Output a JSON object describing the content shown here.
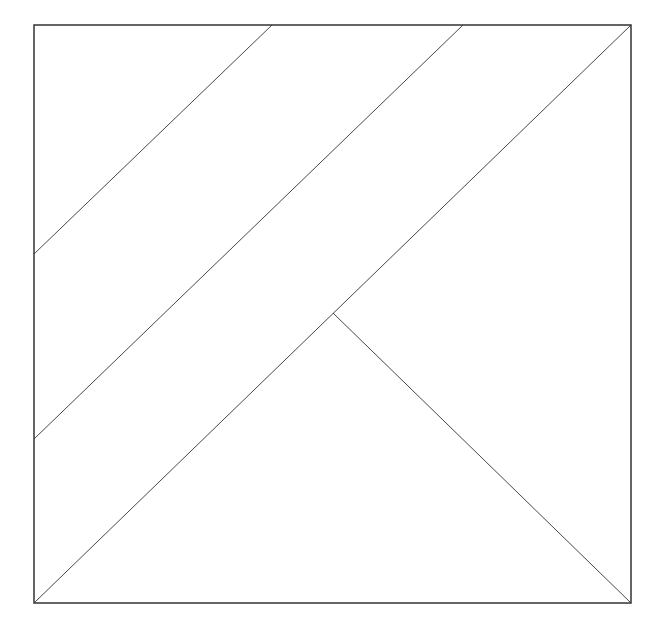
{
  "diagram": {
    "type": "geometric-dissection",
    "stroke_color": "#333333",
    "outer_square": {
      "x1": 34,
      "y1": 25,
      "x2": 631,
      "y2": 603
    },
    "lines": [
      {
        "name": "upper-left-diagonal",
        "x1": 34,
        "y1": 254,
        "x2": 272,
        "y2": 25
      },
      {
        "name": "middle-diagonal",
        "x1": 34,
        "y1": 439,
        "x2": 463,
        "y2": 25
      },
      {
        "name": "main-diagonal",
        "x1": 34,
        "y1": 603,
        "x2": 631,
        "y2": 25
      },
      {
        "name": "apex-to-bottom-right",
        "x1": 333,
        "y1": 313,
        "x2": 631,
        "y2": 603
      }
    ],
    "regions": [
      "top-left-triangle",
      "upper-band",
      "middle-band",
      "right-triangle",
      "bottom-triangle"
    ]
  }
}
